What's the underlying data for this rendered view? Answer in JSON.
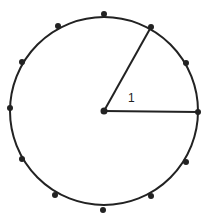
{
  "diagram": {
    "type": "clock-face-circle",
    "center": {
      "x": 104,
      "y": 111
    },
    "radius": 94,
    "marks_count": 12,
    "radii": [
      {
        "to_mark": "1 o'clock",
        "angle_deg": 60
      },
      {
        "to_mark": "3 o'clock",
        "angle_deg": 0
      }
    ],
    "angle_label": "1",
    "stroke_color": "#222222",
    "fill_color": "#ffffff"
  }
}
